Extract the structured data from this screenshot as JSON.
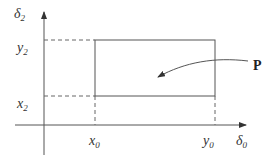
{
  "diagram": {
    "axes": {
      "x_label": {
        "base": "δ",
        "sub": "0"
      },
      "y_label": {
        "base": "δ",
        "sub": "2"
      }
    },
    "ticks": {
      "x": [
        {
          "base": "x",
          "sub": "0"
        },
        {
          "base": "y",
          "sub": "0"
        }
      ],
      "y": [
        {
          "base": "y",
          "sub": "2"
        },
        {
          "base": "x",
          "sub": "2"
        }
      ]
    },
    "region_label": "P",
    "colors": {
      "line": "#555555",
      "text": "#333333"
    }
  }
}
